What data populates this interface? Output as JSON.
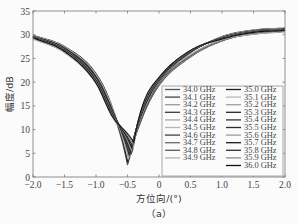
{
  "chart_data": {
    "type": "line",
    "title": "",
    "caption": "（a）",
    "xlabel": "方位向/(°)",
    "ylabel": "幅度/dB",
    "xlim": [
      -2.0,
      2.0
    ],
    "ylim": [
      0,
      35
    ],
    "xticks": [
      "-2.0",
      "-1.5",
      "-1.0",
      "-0.5",
      "0",
      "0.5",
      "1.0",
      "1.5",
      "2.0"
    ],
    "yticks": [
      "0",
      "5",
      "10",
      "15",
      "20",
      "25",
      "30",
      "35"
    ],
    "grid": false,
    "legend_position": "lower right (inside), two columns",
    "x": [
      -2.0,
      -1.5,
      -1.0,
      -0.75,
      -0.5,
      -0.25,
      0.0,
      0.5,
      1.0,
      1.5,
      2.0
    ],
    "series": [
      {
        "name": "34.0 GHz",
        "color": "#555555",
        "null_x": -0.5,
        "null_y": 2.5,
        "values": [
          29.6,
          27.2,
          21.5,
          14.5,
          2.5,
          13.0,
          19.3,
          25.3,
          28.7,
          30.3,
          30.9
        ]
      },
      {
        "name": "34.1 GHz",
        "color": "#444444",
        "null_x": -0.49,
        "null_y": 3.0,
        "values": [
          29.5,
          27.0,
          21.3,
          14.4,
          3.5,
          13.2,
          19.4,
          25.4,
          28.7,
          30.3,
          30.9
        ]
      },
      {
        "name": "34.2 GHz",
        "color": "#9a9a9a",
        "null_x": -0.48,
        "null_y": 3.5,
        "values": [
          29.5,
          26.9,
          21.1,
          14.2,
          4.2,
          13.4,
          19.5,
          25.4,
          28.7,
          30.3,
          30.8
        ]
      },
      {
        "name": "34.3 GHz",
        "color": "#3a3a3a",
        "null_x": -0.47,
        "null_y": 3.8,
        "values": [
          29.4,
          26.8,
          20.9,
          14.0,
          4.8,
          13.6,
          19.6,
          25.5,
          28.8,
          30.3,
          30.8
        ]
      },
      {
        "name": "34.4 GHz",
        "color": "#a8a8a8",
        "null_x": -0.46,
        "null_y": 4.2,
        "values": [
          29.4,
          26.7,
          20.7,
          13.8,
          5.3,
          13.8,
          19.7,
          25.5,
          28.8,
          30.2,
          30.8
        ]
      },
      {
        "name": "34.5 GHz",
        "color": "#b4b4b4",
        "null_x": -0.45,
        "null_y": 4.6,
        "values": [
          29.3,
          26.6,
          20.5,
          13.6,
          5.8,
          14.0,
          19.8,
          25.6,
          28.8,
          30.2,
          30.8
        ]
      },
      {
        "name": "34.6 GHz",
        "color": "#404040",
        "null_x": -0.44,
        "null_y": 5.0,
        "values": [
          29.3,
          26.5,
          20.3,
          13.4,
          6.2,
          14.2,
          19.9,
          25.6,
          28.8,
          30.2,
          30.7
        ]
      },
      {
        "name": "34.7 GHz",
        "color": "#6a6a6a",
        "null_x": -0.43,
        "null_y": 5.3,
        "values": [
          29.2,
          26.4,
          20.1,
          13.2,
          6.7,
          14.4,
          20.0,
          25.7,
          28.9,
          30.2,
          30.7
        ]
      },
      {
        "name": "34.8 GHz",
        "color": "#5a5a5a",
        "null_x": -0.42,
        "null_y": 5.6,
        "values": [
          29.2,
          26.3,
          19.9,
          13.0,
          7.1,
          14.6,
          20.1,
          25.7,
          28.9,
          30.1,
          30.7
        ]
      },
      {
        "name": "34.9 GHz",
        "color": "#b0b0b0",
        "null_x": -0.41,
        "null_y": 5.9,
        "values": [
          29.1,
          26.2,
          19.7,
          12.8,
          7.5,
          14.8,
          20.2,
          25.8,
          28.9,
          30.1,
          30.6
        ]
      },
      {
        "name": "35.0 GHz",
        "color": "#1e1e1e",
        "null_x": -0.5,
        "null_y": 3.2,
        "values": [
          29.9,
          27.5,
          21.8,
          15.0,
          3.2,
          13.5,
          20.0,
          26.2,
          29.6,
          31.0,
          31.4
        ]
      },
      {
        "name": "35.1 GHz",
        "color": "#b8b8b8",
        "null_x": -0.49,
        "null_y": 3.7,
        "values": [
          29.8,
          27.4,
          21.6,
          14.8,
          3.9,
          13.7,
          20.1,
          26.2,
          29.5,
          30.9,
          31.3
        ]
      },
      {
        "name": "35.2 GHz",
        "color": "#a0a0a0",
        "null_x": -0.48,
        "null_y": 4.1,
        "values": [
          29.8,
          27.3,
          21.4,
          14.6,
          4.6,
          13.9,
          20.2,
          26.3,
          29.5,
          30.9,
          31.3
        ]
      },
      {
        "name": "35.3 GHz",
        "color": "#262626",
        "null_x": -0.47,
        "null_y": 4.5,
        "values": [
          29.7,
          27.2,
          21.2,
          14.4,
          5.1,
          14.1,
          20.3,
          26.3,
          29.4,
          30.8,
          31.2
        ]
      },
      {
        "name": "35.4 GHz",
        "color": "#353535",
        "null_x": -0.46,
        "null_y": 4.9,
        "values": [
          29.7,
          27.1,
          21.0,
          14.2,
          5.6,
          14.3,
          20.4,
          26.4,
          29.4,
          30.8,
          31.2
        ]
      },
      {
        "name": "35.5 GHz",
        "color": "#2c2c2c",
        "null_x": -0.45,
        "null_y": 5.3,
        "values": [
          29.6,
          27.0,
          20.8,
          14.0,
          6.1,
          14.5,
          20.5,
          26.4,
          29.3,
          30.7,
          31.1
        ]
      },
      {
        "name": "35.6 GHz",
        "color": "#9c9c9c",
        "null_x": -0.44,
        "null_y": 5.7,
        "values": [
          29.6,
          26.9,
          20.6,
          13.8,
          6.6,
          14.7,
          20.6,
          26.5,
          29.3,
          30.7,
          31.1
        ]
      },
      {
        "name": "35.7 GHz",
        "color": "#1a1a1a",
        "null_x": -0.43,
        "null_y": 6.1,
        "values": [
          29.5,
          26.8,
          20.4,
          13.6,
          7.0,
          14.9,
          20.7,
          26.5,
          29.2,
          30.6,
          31.0
        ]
      },
      {
        "name": "35.8 GHz",
        "color": "#303030",
        "null_x": -0.42,
        "null_y": 6.5,
        "values": [
          29.5,
          26.7,
          20.2,
          13.4,
          7.4,
          15.1,
          20.8,
          26.6,
          29.2,
          30.6,
          31.0
        ]
      },
      {
        "name": "35.9 GHz",
        "color": "#8c8c8c",
        "null_x": -0.41,
        "null_y": 6.9,
        "values": [
          29.4,
          26.6,
          20.0,
          13.2,
          7.7,
          15.3,
          20.9,
          26.6,
          29.1,
          30.5,
          30.9
        ]
      },
      {
        "name": "36.0 GHz",
        "color": "#111111",
        "null_x": -0.4,
        "null_y": 7.3,
        "values": [
          29.4,
          26.5,
          19.8,
          13.0,
          8.0,
          15.5,
          21.0,
          26.7,
          29.1,
          30.5,
          30.9
        ]
      }
    ]
  },
  "layout": {
    "plot": {
      "left": 33,
      "top": 11,
      "right": 285,
      "bottom": 177
    },
    "legend": {
      "left": 162,
      "top": 86,
      "right": 283,
      "bottom": 176
    }
  }
}
